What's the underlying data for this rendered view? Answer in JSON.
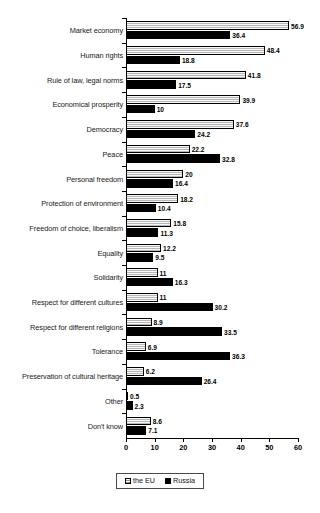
{
  "chart_data": {
    "type": "bar",
    "orientation": "horizontal",
    "title": "",
    "subtitle": "",
    "xlabel": "",
    "ylabel": "",
    "xlim": [
      0,
      60
    ],
    "xticks": [
      0,
      10,
      20,
      30,
      40,
      50,
      60
    ],
    "xtick_labels": [
      "0",
      "10",
      "20",
      "30",
      "40",
      "50",
      "60"
    ],
    "grid": false,
    "legend_position": "bottom-center",
    "categories": [
      "Market economy",
      "Human rights",
      "Rule of law, legal norms",
      "Economical prosperity",
      "Democracy",
      "Peace",
      "Personal freedom",
      "Protection of environment",
      "Freedom of choice, liberalism",
      "Equality",
      "Solidarity",
      "Respect for different cultures",
      "Respect for different religions",
      "Tolerance",
      "Preservation of cultural heritage",
      "Other",
      "Don't know"
    ],
    "series": [
      {
        "name": "the EU",
        "color": "#d2d2d2",
        "pattern": "light-hatched",
        "values": [
          56.9,
          48.4,
          41.8,
          39.9,
          37.6,
          22.2,
          20,
          18.2,
          15.8,
          12.2,
          11,
          11,
          8.9,
          6.9,
          6.2,
          0.5,
          8.6
        ],
        "value_labels": [
          "56.9",
          "48.4",
          "41.8",
          "39.9",
          "37.6",
          "22.2",
          "20",
          "18.2",
          "15.8",
          "12.2",
          "11",
          "11",
          "8.9",
          "6.9",
          "6.2",
          "0.5",
          "8.6"
        ]
      },
      {
        "name": "Russia",
        "color": "#000000",
        "pattern": "solid",
        "values": [
          36.4,
          18.8,
          17.5,
          10,
          24.2,
          32.8,
          16.4,
          10.4,
          11.3,
          9.5,
          16.3,
          30.2,
          33.5,
          36.3,
          26.4,
          2.3,
          7.1
        ],
        "value_labels": [
          "36.4",
          "18.8",
          "17.5",
          "10",
          "24.2",
          "32.8",
          "16.4",
          "10.4",
          "11.3",
          "9.5",
          "16.3",
          "30.2",
          "33.5",
          "36.3",
          "26.4",
          "2.3",
          "7.1"
        ]
      }
    ]
  },
  "legend": {
    "items": [
      {
        "label": "the EU",
        "swatch": "eu-swatch-icon"
      },
      {
        "label": "Russia",
        "swatch": "russia-swatch-icon"
      }
    ]
  }
}
